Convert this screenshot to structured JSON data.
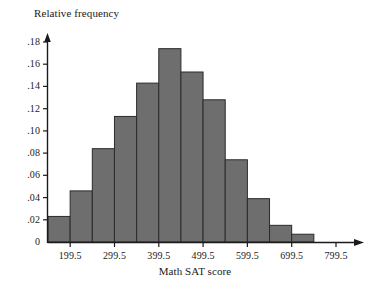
{
  "chart_data": {
    "type": "bar",
    "title": "",
    "xlabel": "Math SAT score",
    "ylabel": "Relative frequency",
    "orientation": "vertical",
    "grid": false,
    "legend": null,
    "bin_width": 50,
    "bin_edges": [
      149.5,
      199.5,
      249.5,
      299.5,
      349.5,
      399.5,
      449.5,
      499.5,
      549.5,
      599.5,
      649.5,
      699.5,
      749.5,
      799.5
    ],
    "categories": [
      "149.5-199.5",
      "199.5-249.5",
      "249.5-299.5",
      "299.5-349.5",
      "349.5-399.5",
      "399.5-449.5",
      "449.5-499.5",
      "499.5-549.5",
      "549.5-599.5",
      "599.5-649.5",
      "649.5-699.5",
      "699.5-749.5",
      "749.5-799.5"
    ],
    "values": [
      0.023,
      0.046,
      0.084,
      0.113,
      0.143,
      0.174,
      0.153,
      0.128,
      0.074,
      0.039,
      0.015,
      0.007,
      0.0
    ],
    "xlim": [
      149.5,
      849.5
    ],
    "ylim": [
      0,
      0.19
    ],
    "x_tick_values": [
      199.5,
      299.5,
      399.5,
      499.5,
      599.5,
      699.5,
      799.5
    ],
    "x_tick_labels": [
      "199.5",
      "299.5",
      "399.5",
      "499.5",
      "599.5",
      "699.5",
      "799.5"
    ],
    "y_tick_values": [
      0,
      0.02,
      0.04,
      0.06,
      0.08,
      0.1,
      0.12,
      0.14,
      0.16,
      0.18
    ],
    "y_tick_labels": [
      "0",
      ".02",
      ".04",
      ".06",
      ".08",
      ".10",
      ".12",
      ".14",
      ".16",
      ".18"
    ],
    "bar_fill_color": "#6e6e6e",
    "bar_edge_color": "#2b2b2b",
    "axis_color": "#1a1a1a"
  },
  "axes": {
    "y_title": "Relative frequency",
    "x_title": "Math SAT score"
  }
}
